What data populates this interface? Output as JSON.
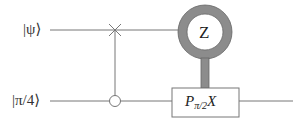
{
  "diagram": {
    "type": "quantum-circuit",
    "wires": [
      {
        "id": "top",
        "label": "|ψ⟩"
      },
      {
        "id": "bottom",
        "label": "|π/4⟩"
      }
    ],
    "gates": [
      {
        "type": "swap-control",
        "top_symbol": "cross",
        "bottom_symbol": "open-circle"
      },
      {
        "type": "measurement",
        "basis": "Z",
        "on_wire": "top"
      },
      {
        "type": "classically-controlled-gate",
        "label_main": "P",
        "label_sub": "π/2",
        "label_tail": "X",
        "on_wire": "bottom"
      }
    ],
    "colors": {
      "wire": "#777777",
      "meter_ring": "#8c8c8c",
      "box_border": "#777777"
    }
  }
}
